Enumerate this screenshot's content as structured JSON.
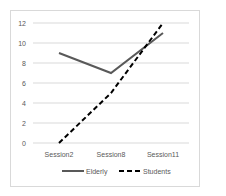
{
  "chart_data": {
    "type": "line",
    "title": "",
    "xlabel": "",
    "ylabel": "",
    "categories": [
      "Session2",
      "Session8",
      "Session11"
    ],
    "series": [
      {
        "name": "Elderly",
        "values": [
          9,
          7,
          11
        ],
        "color": "#595959",
        "style": "solid"
      },
      {
        "name": "Students",
        "values": [
          0,
          5,
          12
        ],
        "color": "#000000",
        "style": "dashed"
      }
    ],
    "ylim": [
      0,
      12
    ],
    "yticks": [
      0,
      2,
      4,
      6,
      8,
      10,
      12
    ],
    "grid": true,
    "legend_position": "bottom"
  },
  "legend": {
    "items": [
      "Elderly",
      "Students"
    ]
  }
}
